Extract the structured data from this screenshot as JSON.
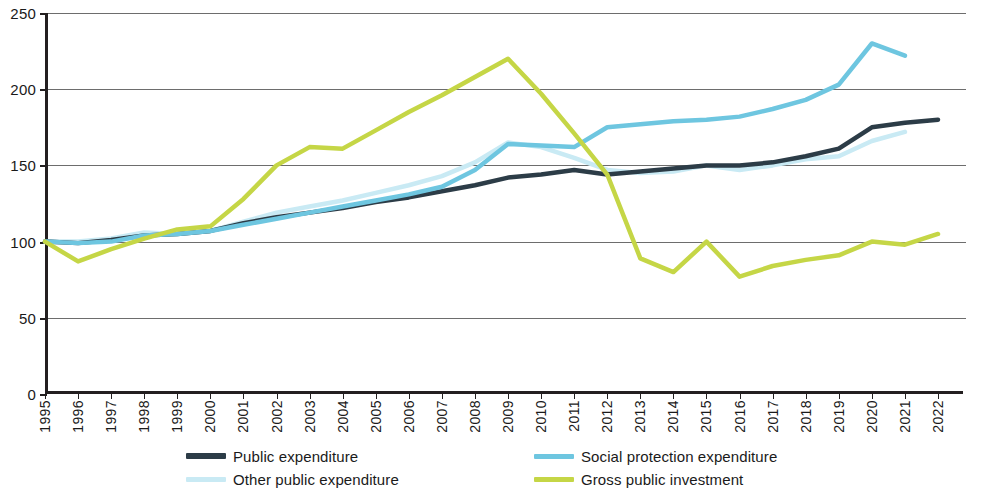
{
  "chart_data": {
    "type": "line",
    "title": "",
    "subtitle": "",
    "xlabel": "",
    "ylabel": "",
    "xlim": [
      1995,
      2022
    ],
    "ylim": [
      0,
      250
    ],
    "y_ticks": [
      0,
      50,
      100,
      150,
      200,
      250
    ],
    "grid": "horizontal",
    "legend_position": "bottom",
    "note": "Index, 1995 = 100",
    "x": [
      1995,
      1996,
      1997,
      1998,
      1999,
      2000,
      2001,
      2002,
      2003,
      2004,
      2005,
      2006,
      2007,
      2008,
      2009,
      2010,
      2011,
      2012,
      2013,
      2014,
      2015,
      2016,
      2017,
      2018,
      2019,
      2020,
      2021,
      2022
    ],
    "series": [
      {
        "name": "Public expenditure",
        "color": "#2c3c47",
        "width": 4.5,
        "values": [
          100,
          99,
          101,
          104,
          105,
          107,
          112,
          116,
          119,
          122,
          126,
          129,
          133,
          137,
          142,
          144,
          147,
          144,
          146,
          148,
          150,
          150,
          152,
          156,
          161,
          175,
          178,
          180
        ]
      },
      {
        "name": "Other public expenditure",
        "color": "#c9eaf4",
        "width": 4.5,
        "values": [
          100,
          100,
          102,
          106,
          105,
          107,
          113,
          119,
          123,
          127,
          132,
          137,
          143,
          152,
          165,
          162,
          155,
          147,
          145,
          146,
          150,
          147,
          150,
          154,
          156,
          166,
          172,
          null
        ]
      },
      {
        "name": "Social protection expenditure",
        "color": "#6ec6e0",
        "width": 4.5,
        "values": [
          100,
          99,
          100,
          104,
          105,
          107,
          111,
          115,
          119,
          123,
          127,
          131,
          136,
          147,
          164,
          163,
          162,
          175,
          177,
          179,
          180,
          182,
          187,
          193,
          203,
          230,
          222,
          null
        ]
      },
      {
        "name": "Gross public investment",
        "color": "#c5d646",
        "width": 4.5,
        "values": [
          100,
          87,
          95,
          102,
          108,
          110,
          128,
          150,
          162,
          161,
          173,
          185,
          196,
          208,
          220,
          197,
          171,
          144,
          89,
          80,
          100,
          77,
          84,
          88,
          91,
          100,
          98,
          105
        ]
      }
    ]
  },
  "axes": {
    "y_tick_labels": [
      "250",
      "200",
      "150",
      "100",
      "50",
      "0"
    ],
    "x_tick_labels": [
      "1995",
      "1996",
      "1997",
      "1998",
      "1999",
      "2000",
      "2001",
      "2002",
      "2003",
      "2004",
      "2005",
      "2006",
      "2007",
      "2008",
      "2009",
      "2010",
      "2011",
      "2012",
      "2013",
      "2014",
      "2015",
      "2016",
      "2017",
      "2018",
      "2019",
      "2020",
      "2021",
      "2022"
    ]
  },
  "legend": {
    "items": [
      {
        "label": "Public expenditure",
        "color": "#2c3c47"
      },
      {
        "label": "Other public expenditure",
        "color": "#c9eaf4"
      },
      {
        "label": "Social protection expenditure",
        "color": "#6ec6e0"
      },
      {
        "label": "Gross public investment",
        "color": "#c5d646"
      }
    ]
  },
  "colors": {
    "axis": "#231f20",
    "grid": "#6d6d6d",
    "background": "#ffffff",
    "text": "#1a1a1a"
  }
}
